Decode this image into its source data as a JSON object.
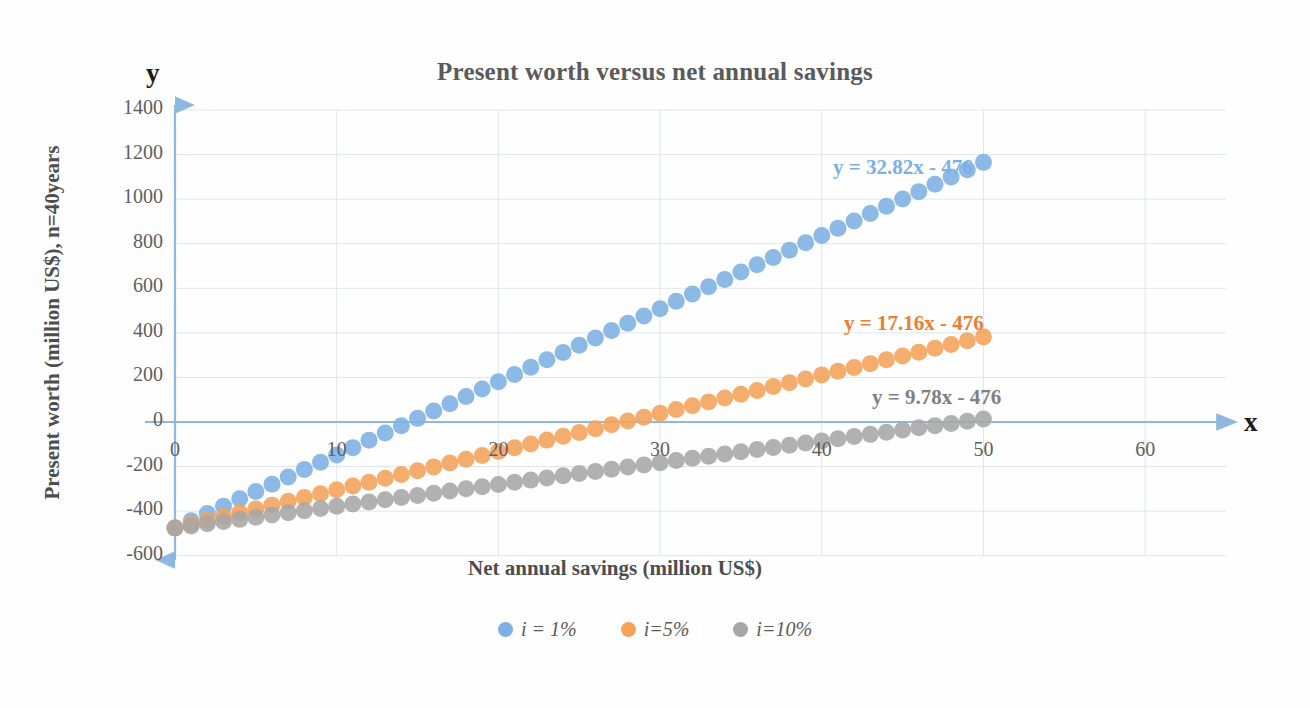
{
  "chart_data": {
    "type": "scatter",
    "title": "Present worth versus net annual savings",
    "xlabel": "Net annual savings (million US$)",
    "ylabel": "Present worth (million US$), n=40years",
    "axis_letter_x": "x",
    "axis_letter_y": "y",
    "xlim": [
      0,
      65
    ],
    "ylim": [
      -600,
      1400
    ],
    "xticks": [
      0,
      10,
      20,
      30,
      40,
      50,
      60
    ],
    "xtick_labels": [
      "0",
      "10",
      "20",
      "30",
      "40",
      "50",
      "60"
    ],
    "yticks": [
      1400,
      1200,
      1000,
      800,
      600,
      400,
      200,
      0,
      -200,
      -400,
      -600
    ],
    "ytick_labels": [
      "1400",
      "1200",
      "1000",
      "800",
      "600",
      "400",
      "200",
      "0",
      "-200",
      "-400",
      "-600"
    ],
    "grid": true,
    "legend_position": "bottom",
    "x": [
      0,
      1,
      2,
      3,
      4,
      5,
      6,
      7,
      8,
      9,
      10,
      11,
      12,
      13,
      14,
      15,
      16,
      17,
      18,
      19,
      20,
      21,
      22,
      23,
      24,
      25,
      26,
      27,
      28,
      29,
      30,
      31,
      32,
      33,
      34,
      35,
      36,
      37,
      38,
      39,
      40,
      41,
      42,
      43,
      44,
      45,
      46,
      47,
      48,
      49,
      50
    ],
    "series": [
      {
        "name": "i = 1%",
        "color": "#7CAFE3",
        "slope": 32.82,
        "intercept": -476,
        "equation": "y = 32.82x - 476",
        "equation_color": "#7CAFE3",
        "values": [
          -476.0,
          -443.2,
          -410.4,
          -377.5,
          -344.7,
          -311.9,
          -279.1,
          -246.3,
          -213.4,
          -180.6,
          -147.8,
          -115.0,
          -82.2,
          -49.3,
          -16.5,
          16.3,
          49.1,
          81.9,
          114.8,
          147.6,
          180.4,
          213.2,
          246.0,
          278.9,
          311.7,
          344.5,
          377.3,
          410.1,
          443.0,
          475.8,
          508.6,
          541.4,
          574.2,
          607.1,
          639.9,
          672.7,
          705.5,
          738.3,
          771.2,
          804.0,
          836.8,
          869.6,
          902.4,
          935.3,
          968.1,
          1000.9,
          1033.7,
          1066.5,
          1099.4,
          1132.2,
          1165.0
        ]
      },
      {
        "name": "i=5%",
        "color": "#F4A259",
        "slope": 17.16,
        "intercept": -476,
        "equation": "y = 17.16x - 476",
        "equation_color": "#ED7D31",
        "values": [
          -476.0,
          -458.8,
          -441.7,
          -424.5,
          -407.4,
          -390.2,
          -373.0,
          -355.9,
          -338.7,
          -321.6,
          -304.4,
          -287.2,
          -270.1,
          -252.9,
          -235.8,
          -218.6,
          -201.4,
          -184.3,
          -167.1,
          -150.0,
          -132.8,
          -115.6,
          -98.5,
          -81.3,
          -64.2,
          -47.0,
          -29.8,
          -12.7,
          4.5,
          21.6,
          38.8,
          56.0,
          73.1,
          90.3,
          107.4,
          124.6,
          141.8,
          158.9,
          176.1,
          193.2,
          210.4,
          227.6,
          244.7,
          261.9,
          279.0,
          296.2,
          313.4,
          330.5,
          347.7,
          364.8,
          382.0
        ]
      },
      {
        "name": "i=10%",
        "color": "#A6A6A6",
        "slope": 9.78,
        "intercept": -476,
        "equation": "y = 9.78x - 476",
        "equation_color": "#808080",
        "values": [
          -476.0,
          -466.2,
          -456.4,
          -446.7,
          -436.9,
          -427.1,
          -417.3,
          -407.5,
          -397.8,
          -388.0,
          -378.2,
          -368.4,
          -358.6,
          -348.9,
          -339.1,
          -329.3,
          -319.5,
          -309.7,
          -300.0,
          -290.2,
          -280.4,
          -270.6,
          -260.8,
          -251.1,
          -241.3,
          -231.5,
          -221.7,
          -211.9,
          -202.2,
          -192.4,
          -182.6,
          -172.8,
          -163.0,
          -153.3,
          -143.5,
          -133.7,
          -123.9,
          -114.1,
          -104.4,
          -94.6,
          -84.8,
          -75.0,
          -65.2,
          -55.5,
          -45.7,
          -35.9,
          -26.1,
          -16.3,
          -6.6,
          3.2,
          13.0
        ]
      }
    ]
  },
  "legend": [
    {
      "label": "i = 1%",
      "color": "#7CAFE3"
    },
    {
      "label": "i=5%",
      "color": "#F4A259"
    },
    {
      "label": "i=10%",
      "color": "#A6A6A6"
    }
  ],
  "axis_color": "#8FB8E0",
  "grid_color": "#DCE6F1"
}
